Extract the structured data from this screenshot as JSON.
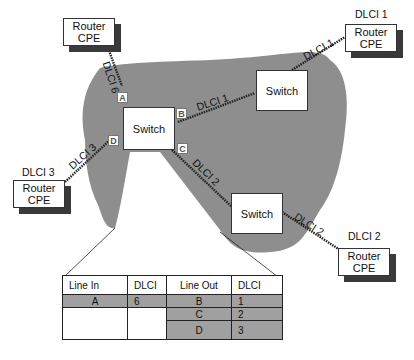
{
  "diagram": {
    "colors": {
      "cloud": "#8e8e8e",
      "shadow": "#3a3a3a",
      "table_fill": "#a0a0a0"
    },
    "routers": [
      {
        "id": "r-top-left",
        "line1": "Router",
        "line2": "CPE",
        "dlci_label": ""
      },
      {
        "id": "r-top-right",
        "line1": "Router",
        "line2": "CPE",
        "dlci_label": "DLCI 1"
      },
      {
        "id": "r-left",
        "line1": "Router",
        "line2": "CPE",
        "dlci_label": "DLCI 3"
      },
      {
        "id": "r-bottom-right",
        "line1": "Router",
        "line2": "CPE",
        "dlci_label": "DLCI 2"
      }
    ],
    "switches": [
      {
        "id": "sw-center",
        "label": "Switch"
      },
      {
        "id": "sw-top-right",
        "label": "Switch"
      },
      {
        "id": "sw-bottom-right",
        "label": "Switch"
      }
    ],
    "ports": [
      "A",
      "B",
      "C",
      "D"
    ],
    "links": [
      {
        "label": "DLCI 6"
      },
      {
        "label": "DLCI 1"
      },
      {
        "label": "DLCI 1"
      },
      {
        "label": "DLCI 3"
      },
      {
        "label": "DLCI 2"
      },
      {
        "label": "DLCI 2"
      }
    ],
    "table": {
      "headers": [
        "Line In",
        "DLCI",
        "Line Out",
        "DLCI"
      ],
      "in_rows": [
        {
          "line": "A",
          "dlci": "6"
        }
      ],
      "out_rows": [
        {
          "line": "B",
          "dlci": "1"
        },
        {
          "line": "C",
          "dlci": "2"
        },
        {
          "line": "D",
          "dlci": "3"
        }
      ]
    }
  }
}
